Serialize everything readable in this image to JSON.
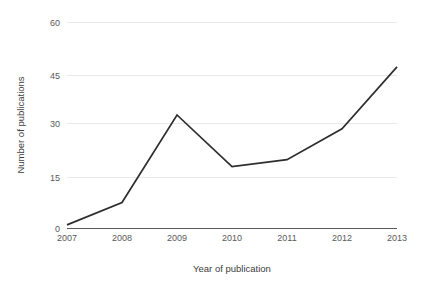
{
  "chart_data": {
    "type": "line",
    "title": "",
    "subtitle": "",
    "xlabel": "Year of publication",
    "ylabel": "Number of publications",
    "categories": [
      "2007",
      "2008",
      "2009",
      "2010",
      "2011",
      "2012",
      "2013"
    ],
    "x": [
      2007,
      2008,
      2009,
      2010,
      2011,
      2012,
      2013
    ],
    "series": [
      {
        "name": "Number of publications",
        "values": [
          1,
          7.5,
          33,
          18,
          20,
          29,
          47
        ],
        "color": "#2e2e2e"
      }
    ],
    "values": [
      1,
      7.5,
      33,
      18,
      20,
      29,
      47
    ],
    "xlim": [
      2007,
      2013
    ],
    "ylim": [
      0,
      60
    ],
    "yticks": [
      0,
      15,
      30,
      45,
      60
    ],
    "ytick_labels": [
      "0",
      "15",
      "30",
      "45",
      "60"
    ],
    "xtick_labels": [
      "2007",
      "2008",
      "2009",
      "2010",
      "2011",
      "2012",
      "2013"
    ],
    "grid": "horizontal",
    "grid_color": "#e9e9e9",
    "legend": "none",
    "legend_position": "none",
    "annotations": [],
    "background_color": "#ffffff",
    "axis_color": "#5a5a5a"
  },
  "axes": {
    "y_title": "Number of publications",
    "x_title": "Year of publication",
    "y_ticks": [
      {
        "label": "60",
        "value": 60
      },
      {
        "label": "45",
        "value": 45
      },
      {
        "label": "30",
        "value": 30
      },
      {
        "label": "15",
        "value": 15
      },
      {
        "label": "0",
        "value": 0
      }
    ],
    "x_ticks": [
      {
        "label": "2007",
        "value": 2007
      },
      {
        "label": "2008",
        "value": 2008
      },
      {
        "label": "2009",
        "value": 2009
      },
      {
        "label": "2010",
        "value": 2010
      },
      {
        "label": "2011",
        "value": 2011
      },
      {
        "label": "2012",
        "value": 2012
      },
      {
        "label": "2013",
        "value": 2013
      }
    ]
  }
}
